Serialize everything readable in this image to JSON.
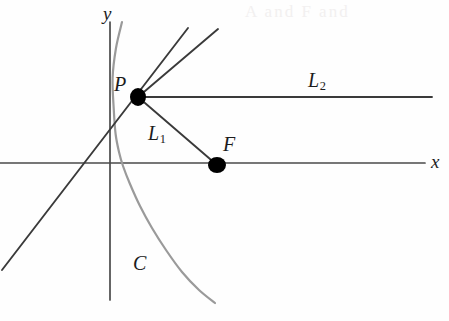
{
  "figure": {
    "caption_labels": {
      "y_axis": "y",
      "x_axis": "x",
      "point_p": "P",
      "point_f": "F",
      "segment_l1_main": "L",
      "segment_l1_sub": "1",
      "ray_l2_main": "L",
      "ray_l2_sub": "2",
      "curve_c": "C"
    },
    "bleed_through_text": "A  and  F  and",
    "colors": {
      "ink": "#3a3a3a",
      "axis": "#4a4a4a",
      "curve": "#9a9a9a",
      "point_fill": "#000000",
      "background": "#fefefe",
      "bleed": "#f2f0f0"
    }
  },
  "chart_data": {
    "type": "line",
    "title": "",
    "subtitle": "",
    "xlabel": "x",
    "ylabel": "y",
    "grid": false,
    "legend": "none",
    "axes": {
      "x_axis_pixel_y": 163,
      "y_axis_pixel_x": 110,
      "x_axis_extent_px": [
        0,
        425
      ],
      "y_axis_extent_px": [
        22,
        300
      ],
      "origin_px": [
        110,
        163
      ]
    },
    "annotations": [
      {
        "name": "P",
        "label": "P",
        "type": "point",
        "px": [
          138,
          97
        ],
        "label_px": [
          122,
          86
        ],
        "marker": "filled-ellipse",
        "marker_rx": 8,
        "marker_ry": 9
      },
      {
        "name": "F",
        "label": "F",
        "type": "point",
        "px": [
          217,
          165
        ],
        "label_px": [
          230,
          147
        ],
        "marker": "filled-ellipse",
        "marker_rx": 9,
        "marker_ry": 8
      },
      {
        "name": "L1",
        "label": "L₁",
        "type": "segment-label",
        "label_px": [
          158,
          136
        ]
      },
      {
        "name": "L2",
        "label": "L₂",
        "type": "segment-label",
        "label_px": [
          320,
          83
        ]
      },
      {
        "name": "C",
        "label": "C",
        "type": "curve-label",
        "label_px": [
          140,
          266
        ]
      }
    ],
    "series": [
      {
        "name": "C",
        "role": "parabola",
        "description": "Rightward-opening parabola, focus at F, vertex left of focus on the x-axis",
        "color": "#9a9a9a",
        "width": 2.2,
        "points_px": [
          [
            122,
            22
          ],
          [
            116,
            48
          ],
          [
            112.6,
            78
          ],
          [
            113.8,
            110
          ],
          [
            115.6,
            134
          ],
          [
            119,
            152
          ],
          [
            123,
            166
          ],
          [
            130,
            184
          ],
          [
            140,
            206
          ],
          [
            152,
            228
          ],
          [
            166,
            250
          ],
          [
            182,
            272
          ],
          [
            199,
            290
          ],
          [
            215,
            303
          ]
        ]
      },
      {
        "name": "L1",
        "role": "focal-radius",
        "description": "Segment from P to focus F",
        "color": "#3a3a3a",
        "width": 1.9,
        "points_px": [
          [
            138,
            97
          ],
          [
            217,
            165
          ]
        ]
      },
      {
        "name": "L2",
        "role": "reflected-ray",
        "description": "Horizontal ray from P to the right, parallel to the axis",
        "color": "#3a3a3a",
        "width": 1.9,
        "points_px": [
          [
            138,
            97
          ],
          [
            432,
            97
          ]
        ]
      },
      {
        "name": "tangent",
        "role": "tangent-line",
        "description": "Tangent line to C at P, extended both directions",
        "color": "#3a3a3a",
        "width": 1.9,
        "points_px": [
          [
            2,
            270
          ],
          [
            188,
            28
          ]
        ]
      },
      {
        "name": "secondary-ray",
        "role": "incoming-ray",
        "description": "Second ray from P going up and to the right, slightly shallower than the tangent",
        "color": "#3a3a3a",
        "width": 1.9,
        "points_px": [
          [
            138,
            97
          ],
          [
            218,
            29
          ]
        ]
      },
      {
        "name": "x-axis",
        "role": "axis",
        "color": "#4a4a4a",
        "width": 1.7,
        "points_px": [
          [
            0,
            163
          ],
          [
            425,
            163
          ]
        ]
      },
      {
        "name": "y-axis",
        "role": "axis",
        "color": "#4a4a4a",
        "width": 1.7,
        "points_px": [
          [
            110,
            22
          ],
          [
            110,
            300
          ]
        ]
      }
    ]
  }
}
